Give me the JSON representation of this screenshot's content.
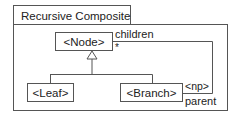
{
  "diagram": {
    "title": "Recursive Composite",
    "classes": [
      {
        "id": "node",
        "label": "<Node>"
      },
      {
        "id": "leaf",
        "label": "<Leaf>"
      },
      {
        "id": "branch",
        "label": "<Branch>"
      }
    ],
    "association": {
      "children_role": "children",
      "children_multiplicity": "*",
      "parent_qualifier": "<np>",
      "parent_role": "parent"
    },
    "colors": {
      "stroke": "#555555",
      "text": "#222222",
      "background": "#ffffff"
    }
  }
}
